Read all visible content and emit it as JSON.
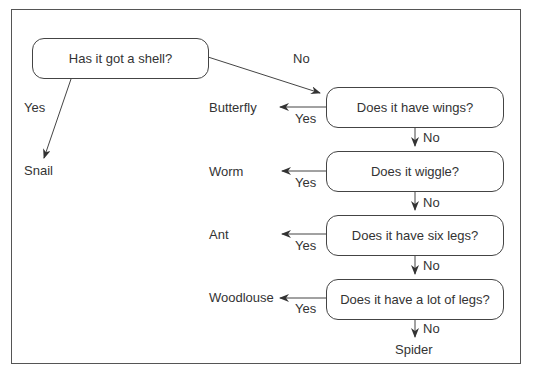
{
  "diagram": {
    "type": "decision-tree",
    "root": {
      "question": "Has it got a shell?",
      "yes_label": "Yes",
      "no_label": "No",
      "yes_result": "Snail"
    },
    "questions": [
      {
        "question": "Does it have wings?",
        "yes_label": "Yes",
        "yes_result": "Butterfly",
        "no_label": "No"
      },
      {
        "question": "Does it wiggle?",
        "yes_label": "Yes",
        "yes_result": "Worm",
        "no_label": "No"
      },
      {
        "question": "Does it have six legs?",
        "yes_label": "Yes",
        "yes_result": "Ant",
        "no_label": "No"
      },
      {
        "question": "Does it have a lot of legs?",
        "yes_label": "Yes",
        "yes_result": "Woodlouse",
        "no_label": "No"
      }
    ],
    "final_result": "Spider",
    "colors": {
      "line": "#444444",
      "text": "#333333",
      "background": "#ffffff"
    }
  }
}
